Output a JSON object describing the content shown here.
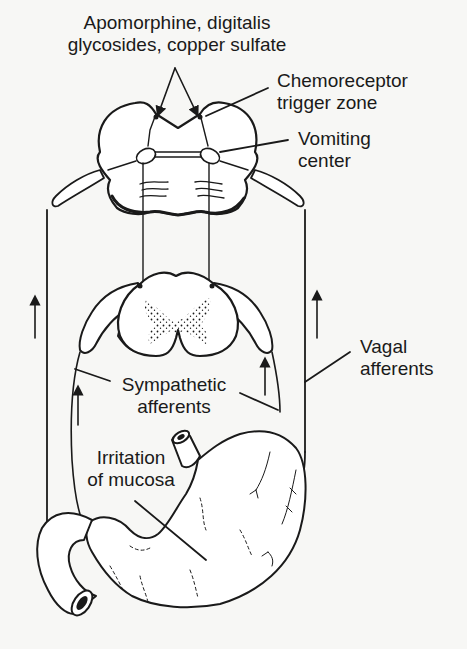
{
  "diagram": {
    "type": "anatomical pathway diagram",
    "colors": {
      "ink": "#1a1a1a",
      "background": "#f7f7f5"
    }
  },
  "labels": {
    "drugs": {
      "line1": "Apomorphine, digitalis",
      "line2": "glycosides, copper sulfate"
    },
    "ctz": {
      "line1": "Chemoreceptor",
      "line2": "trigger zone"
    },
    "vomiting_center": {
      "line1": "Vomiting",
      "line2": "center"
    },
    "vagal": {
      "line1": "Vagal",
      "line2": "afferents"
    },
    "sympathetic": {
      "line1": "Sympathetic",
      "line2": "afferents"
    },
    "irritation": {
      "line1": "Irritation",
      "line2": "of mucosa"
    }
  },
  "structures": [
    "medulla-oblongata-section",
    "spinal-cord-section",
    "stomach",
    "duodenum",
    "esophagus"
  ],
  "arrows": [
    {
      "name": "vagal-left-arrow",
      "direction": "up"
    },
    {
      "name": "vagal-right-arrow",
      "direction": "up"
    },
    {
      "name": "sympathetic-left-arrow",
      "direction": "up"
    },
    {
      "name": "sympathetic-right-arrow",
      "direction": "up"
    }
  ]
}
